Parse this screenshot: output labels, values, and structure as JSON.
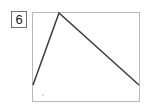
{
  "panel": {
    "label": "6",
    "label_icon": "number-badge"
  },
  "colors": {
    "line": "#3c3c3c",
    "frame_border": "#b9b9b9",
    "label_border": "#6f6f6f",
    "background": "#ffffff",
    "marker": "#cccccc"
  },
  "chart_data": {
    "type": "line",
    "title": "6",
    "xlabel": "",
    "ylabel": "",
    "xlim": [
      0,
      108
    ],
    "ylim": [
      0,
      90
    ],
    "grid": false,
    "legend": null,
    "tick_labels": {
      "x": [],
      "y": []
    },
    "annotations": [],
    "series": [
      {
        "name": "series-1",
        "x": [
          1,
          27,
          107
        ],
        "y": [
          17,
          89,
          17
        ],
        "points": [
          {
            "x": 1,
            "y": 17,
            "role": "start"
          },
          {
            "x": 27,
            "y": 89,
            "role": "peak"
          },
          {
            "x": 107,
            "y": 17,
            "role": "end"
          }
        ]
      }
    ],
    "markers": [
      {
        "x": 11,
        "y": 7,
        "role": "faint-point"
      }
    ]
  }
}
